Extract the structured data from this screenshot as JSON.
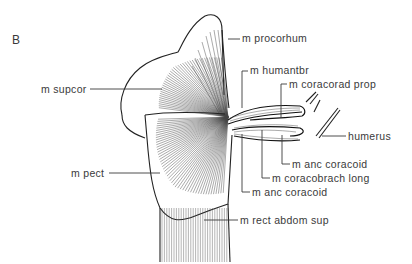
{
  "figure": {
    "panel_label": "B",
    "labels": [
      {
        "id": "procorhum",
        "text": "m procorhum"
      },
      {
        "id": "supcor",
        "text": "m supcor"
      },
      {
        "id": "humantbr",
        "text": "m humantbr"
      },
      {
        "id": "coracorad_prop",
        "text": "m coracorad prop"
      },
      {
        "id": "humerus",
        "text": "humerus"
      },
      {
        "id": "anc_coracoid_1",
        "text": "m anc coracoid"
      },
      {
        "id": "coracobrach_long",
        "text": "m coracobrach long"
      },
      {
        "id": "anc_coracoid_2",
        "text": "m anc coracoid"
      },
      {
        "id": "pect",
        "text": "m pect"
      },
      {
        "id": "rect_abdom_sup",
        "text": "m rect abdom sup"
      }
    ]
  }
}
